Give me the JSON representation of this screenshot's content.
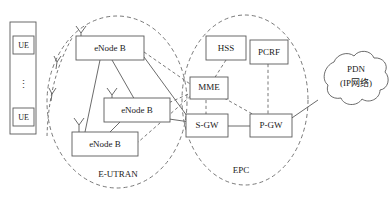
{
  "diagram": {
    "zones": [
      {
        "id": "eutran",
        "label": "E-UTRAN"
      },
      {
        "id": "epc",
        "label": "EPC"
      }
    ],
    "ue_stack": {
      "items": [
        {
          "label": "UE"
        },
        {
          "label": "UE"
        }
      ],
      "ellipsis": "⋮"
    },
    "enodebs": [
      {
        "label": "eNode B"
      },
      {
        "label": "eNode B"
      },
      {
        "label": "eNode B"
      }
    ],
    "epc_nodes": [
      {
        "id": "hss",
        "label": "HSS"
      },
      {
        "id": "pcrf",
        "label": "PCRF"
      },
      {
        "id": "mme",
        "label": "MME"
      },
      {
        "id": "sgw",
        "label": "S-GW"
      },
      {
        "id": "pgw",
        "label": "P-GW"
      }
    ],
    "cloud": {
      "line1": "PDN",
      "line2": "(IP网络)"
    },
    "colors": {
      "stroke": "#5a5a5a",
      "dashed_stroke": "#6a6a6a",
      "text": "#1a1a1a",
      "background": "#ffffff"
    }
  }
}
